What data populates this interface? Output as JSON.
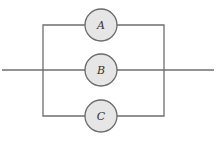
{
  "diagram": {
    "type": "parallel-system",
    "components": [
      {
        "label": "A",
        "cx": 101,
        "cy": 25
      },
      {
        "label": "B",
        "cx": 101,
        "cy": 70
      },
      {
        "label": "C",
        "cx": 101,
        "cy": 116
      }
    ],
    "colors": {
      "line": "#6e6e6e",
      "node_fill": "#e6e6e6",
      "node_stroke": "#6a6a6a"
    }
  }
}
